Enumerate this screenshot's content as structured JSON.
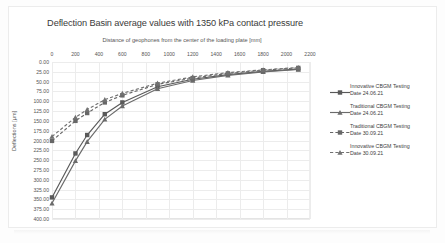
{
  "chart_data": {
    "type": "line",
    "title": "Deflection Basin average values with 1350 kPa contact pressure",
    "xlabel": "Distance of geophones from the center of the loading plate [mm]",
    "ylabel": "Deflections [µm]",
    "xlim": [
      0,
      2200
    ],
    "ylim": [
      0,
      400
    ],
    "y_inverted": true,
    "x_axis_position": "top",
    "grid": true,
    "legend_position": "right",
    "xticks": [
      0,
      200,
      400,
      600,
      800,
      1000,
      1200,
      1400,
      1600,
      1800,
      2000,
      2200
    ],
    "xtick_labels": [
      "0",
      "200",
      "400",
      "600",
      "800",
      "1000",
      "1200",
      "1400",
      "1600",
      "1800",
      "2000",
      "2200"
    ],
    "yticks": [
      0,
      25,
      50,
      75,
      100,
      125,
      150,
      175,
      200,
      225,
      250,
      275,
      300,
      325,
      350,
      375,
      400
    ],
    "ytick_labels": [
      "0.00",
      "25.00",
      "50.00",
      "75.00",
      "100.00",
      "125.00",
      "150.00",
      "175.00",
      "200.00",
      "225.00",
      "250.00",
      "275.00",
      "300.00",
      "325.00",
      "350.00",
      "375.00",
      "400.00"
    ],
    "x": [
      0,
      200,
      300,
      450,
      600,
      900,
      1200,
      1500,
      1800,
      2100
    ],
    "series": [
      {
        "name": "Innovative CBGM Testing Date 24.06.21",
        "label_line1": "Innovative CBGM Testing",
        "label_line2": "Date 24.06.21",
        "style": "solid",
        "marker": "square",
        "color": "#595959",
        "values": [
          345.0,
          233.0,
          186.0,
          133.0,
          103.0,
          63.0,
          44.0,
          32.0,
          24.0,
          18.0
        ]
      },
      {
        "name": "Traditional CBGM Testing Date 24.06.21",
        "label_line1": "Traditional CBGM Testing",
        "label_line2": "Date 24.06.21",
        "style": "solid",
        "marker": "triangle",
        "color": "#6b6b6b",
        "values": [
          360.0,
          252.0,
          203.0,
          146.0,
          112.0,
          68.0,
          47.0,
          34.0,
          25.0,
          19.0
        ]
      },
      {
        "name": "Traditional CBGM Testing Date 30.09.21",
        "label_line1": "Traditional CBGM Testing",
        "label_line2": "Date 30.09.21",
        "style": "dashed",
        "marker": "square",
        "color": "#676767",
        "values": [
          201.0,
          150.0,
          130.0,
          103.0,
          85.0,
          57.0,
          41.0,
          29.0,
          21.0,
          15.0
        ]
      },
      {
        "name": "Innovative CBGM Testing Date 30.09.21",
        "label_line1": "Innovative CBGM Testing",
        "label_line2": "Date 30.09.21",
        "style": "dashed",
        "marker": "triangle",
        "color": "#717171",
        "values": [
          190.0,
          141.0,
          121.0,
          96.0,
          80.0,
          54.0,
          38.0,
          27.0,
          20.0,
          14.0
        ]
      }
    ]
  }
}
